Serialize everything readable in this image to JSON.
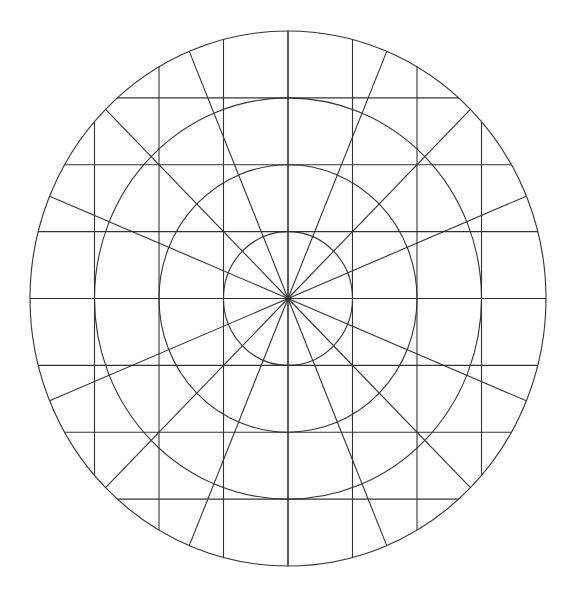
{
  "diagram": {
    "type": "polar-grid",
    "canvas": {
      "width": 575,
      "height": 597,
      "background": "#ffffff"
    },
    "stroke_color": "#333333",
    "center": {
      "x": 288,
      "y": 298.5
    },
    "unit": {
      "rx": 64.5,
      "ry": 66.875
    },
    "rings": [
      1,
      2,
      3,
      4
    ],
    "spoke_count": 16,
    "spoke_step_deg": 22.5,
    "grid": {
      "vertical_x_steps": [
        -3,
        -2,
        -1,
        0,
        1,
        2,
        3
      ],
      "horizontal_y_steps": [
        -3,
        -2,
        -1,
        0,
        1,
        2,
        3
      ]
    }
  }
}
